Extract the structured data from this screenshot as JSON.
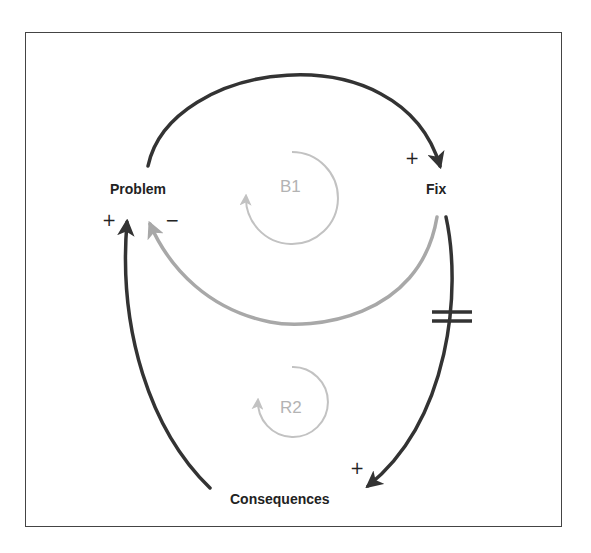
{
  "diagram": {
    "type": "causal-loop",
    "colors": {
      "frame": "#444444",
      "primary_link": "#333333",
      "balancing_link": "#a8a8a8",
      "loop_marker": "#c2c2c2",
      "loop_label": "#b3b3b3",
      "text": "#222222"
    },
    "nodes": {
      "problem": "Problem",
      "fix": "Fix",
      "consequences": "Consequences"
    },
    "links": [
      {
        "from": "Problem",
        "to": "Fix",
        "polarity": "+",
        "delay": false
      },
      {
        "from": "Fix",
        "to": "Problem",
        "polarity": "−",
        "delay": false
      },
      {
        "from": "Fix",
        "to": "Consequences",
        "polarity": "+",
        "delay": true
      },
      {
        "from": "Consequences",
        "to": "Problem",
        "polarity": "+",
        "delay": false
      }
    ],
    "polarities": {
      "problem_to_fix": "+",
      "fix_to_problem": "−",
      "fix_to_consequences": "+",
      "consequences_to_problem": "+"
    },
    "loops": {
      "balancing": "B1",
      "reinforcing": "R2"
    },
    "delay_marker": "="
  }
}
